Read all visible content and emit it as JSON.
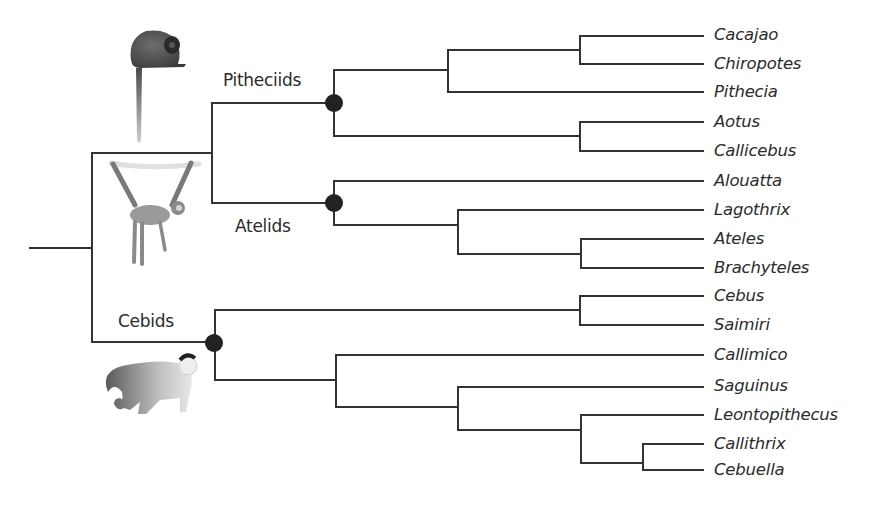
{
  "diagram": {
    "type": "phylogenetic-tree",
    "clades": [
      {
        "name": "Pitheciids",
        "taxa": [
          "Cacajao",
          "Chiropotes",
          "Pithecia",
          "Aotus",
          "Callicebus"
        ]
      },
      {
        "name": "Atelids",
        "taxa": [
          "Alouatta",
          "Lagothrix",
          "Ateles",
          "Brachyteles"
        ]
      },
      {
        "name": "Cebids",
        "taxa": [
          "Cebus",
          "Saimiri",
          "Callimico",
          "Saguinus",
          "Leontopithecus",
          "Callithrix",
          "Cebuella"
        ]
      }
    ],
    "clade_labels": {
      "pitheciids": "Pitheciids",
      "atelids": "Atelids",
      "cebids": "Cebids"
    },
    "taxa": [
      {
        "name": "Cacajao",
        "y": 36
      },
      {
        "name": "Chiropotes",
        "y": 64
      },
      {
        "name": "Pithecia",
        "y": 92
      },
      {
        "name": "Aotus",
        "y": 122
      },
      {
        "name": "Callicebus",
        "y": 151
      },
      {
        "name": "Alouatta",
        "y": 181
      },
      {
        "name": "Lagothrix",
        "y": 210
      },
      {
        "name": "Ateles",
        "y": 239
      },
      {
        "name": "Brachyteles",
        "y": 268
      },
      {
        "name": "Cebus",
        "y": 296
      },
      {
        "name": "Saimiri",
        "y": 325
      },
      {
        "name": "Callimico",
        "y": 355
      },
      {
        "name": "Saguinus",
        "y": 387
      },
      {
        "name": "Leontopithecus",
        "y": 415
      },
      {
        "name": "Callithrix",
        "y": 444
      },
      {
        "name": "Cebuella",
        "y": 470
      }
    ],
    "illustrations": [
      "titi-monkey-icon",
      "spider-monkey-icon",
      "capuchin-monkey-icon"
    ],
    "colors": {
      "line": "#333333",
      "node": "#222222",
      "text": "#2b2b2b"
    }
  }
}
